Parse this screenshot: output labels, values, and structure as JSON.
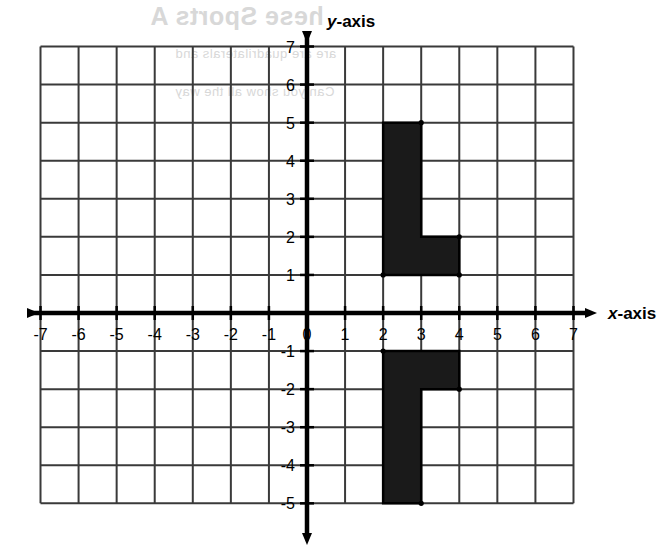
{
  "figure": {
    "title_ghost": "hese Sports A",
    "ghost_sub_1": "are are quadrilaterals and",
    "ghost_sub_2": "Can you show all the way",
    "x_axis_label": "x-axis",
    "y_axis_label": "y-axis",
    "origin_label": "0"
  },
  "chart_data": {
    "type": "scatter",
    "title": "",
    "xlabel": "x-axis",
    "ylabel": "y-axis",
    "xlim": [
      -7,
      7
    ],
    "ylim": [
      -5,
      7
    ],
    "grid": true,
    "legend": "none",
    "x_ticks": [
      -7,
      -6,
      -5,
      -4,
      -3,
      -2,
      -1,
      0,
      1,
      2,
      3,
      4,
      5,
      6,
      7
    ],
    "x_tick_labels": [
      "-7",
      "-6",
      "-5",
      "-4",
      "-3",
      "-2",
      "-1",
      "0",
      "1",
      "2",
      "3",
      "4",
      "5",
      "6",
      "7"
    ],
    "y_ticks": [
      -5,
      -4,
      -3,
      -2,
      -1,
      1,
      2,
      3,
      4,
      5,
      6,
      7
    ],
    "y_tick_labels": [
      "-5",
      "-4",
      "-3",
      "-2",
      "-1",
      "1",
      "2",
      "3",
      "4",
      "5",
      "6",
      "7"
    ],
    "grid_step": 1,
    "shapes": [
      {
        "name": "upper-l-shape",
        "type": "polygon",
        "fill": "#1a1a1a",
        "stroke": "#000000",
        "vertices": [
          [
            2,
            5
          ],
          [
            3,
            5
          ],
          [
            3,
            2
          ],
          [
            4,
            2
          ],
          [
            4,
            1
          ],
          [
            2,
            1
          ]
        ],
        "vertex_markers": [
          [
            3,
            5
          ],
          [
            4,
            2
          ],
          [
            4,
            1
          ],
          [
            2,
            1
          ]
        ]
      },
      {
        "name": "lower-l-shape-reflection",
        "type": "polygon",
        "fill": "#1a1a1a",
        "stroke": "#000000",
        "vertices": [
          [
            2,
            -1
          ],
          [
            4,
            -1
          ],
          [
            4,
            -2
          ],
          [
            3,
            -2
          ],
          [
            3,
            -5
          ],
          [
            2,
            -5
          ]
        ],
        "vertex_markers": [
          [
            2,
            -1
          ],
          [
            4,
            -2
          ],
          [
            3,
            -5
          ]
        ]
      }
    ],
    "colors": {
      "grid": "#3a3a3a",
      "axis": "#000000",
      "shape_fill": "#1a1a1a",
      "background": "#ffffff"
    }
  }
}
